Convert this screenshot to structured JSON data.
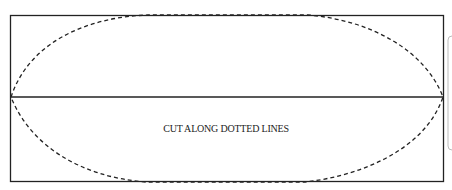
{
  "diagram": {
    "instruction": "CUT ALONG DOTTED LINES",
    "colors": {
      "line": "#222222",
      "side_box": "#bbbbbb"
    }
  }
}
